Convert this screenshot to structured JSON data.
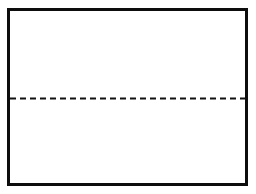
{
  "figure": {
    "title": "",
    "background_color": "#ffffff",
    "width": 256,
    "height": 194
  },
  "outer_rectangle": {
    "name": "outer-rectangle",
    "stroke_color": "#0d0d0d",
    "stroke_width": 3,
    "fill_color": "#ffffff",
    "x": 7,
    "y": 8,
    "width": 241,
    "height": 178
  },
  "dashed_line": {
    "name": "dashed-midline",
    "orientation": "horizontal",
    "stroke_color": "#111111",
    "stroke_width": 2,
    "dash_length": 6,
    "gap_length": 4,
    "y": 98,
    "x_start": 10,
    "x_end": 246,
    "label": ""
  },
  "regions": {
    "upper_label": "",
    "lower_label": ""
  },
  "annotations": []
}
